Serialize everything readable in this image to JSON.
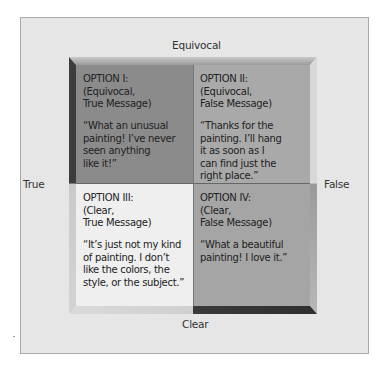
{
  "diagram": {
    "axes": {
      "top": "Equivocal",
      "bottom": "Clear",
      "left": "True",
      "right": "False"
    },
    "quadrants": [
      {
        "id": "option-1",
        "title_lines": [
          "OPTION I:",
          "(Equivocal,",
          "True Message)"
        ],
        "quote_lines": [
          "“What an unusual",
          "painting! I’ve never",
          "seen anything",
          "like it!”"
        ],
        "color": "#8b8b8b"
      },
      {
        "id": "option-2",
        "title_lines": [
          "OPTION II:",
          "(Equivocal,",
          "False Message)"
        ],
        "quote_lines": [
          "“Thanks for the",
          "painting. I’ll hang",
          "it as soon as I",
          "can find just the",
          "right place.”"
        ],
        "color": "#a9a9a9"
      },
      {
        "id": "option-3",
        "title_lines": [
          "OPTION III:",
          "(Clear,",
          "True Message)"
        ],
        "quote_lines": [
          "“It’s just not my kind",
          "of painting. I don’t",
          "like the colors, the",
          "style, or the subject.”"
        ],
        "color": "#efefef"
      },
      {
        "id": "option-4",
        "title_lines": [
          "OPTION IV:",
          "(Clear,",
          "False Message)"
        ],
        "quote_lines": [
          "“What a beautiful",
          "painting! I love it.”"
        ],
        "color": "#a5a5a5"
      }
    ]
  }
}
